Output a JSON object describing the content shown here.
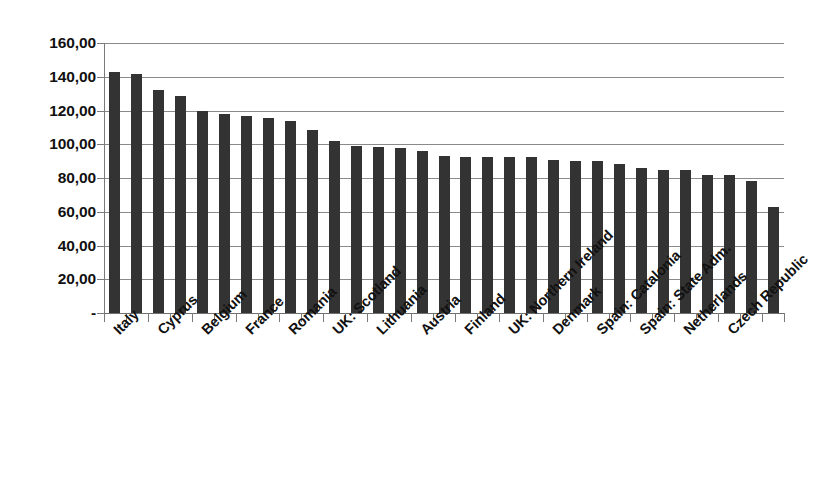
{
  "chart_data": {
    "type": "bar",
    "title": "",
    "subtitle": "",
    "xlabel": "",
    "ylabel": "",
    "ylim": [
      0,
      160
    ],
    "ytick_step": 20,
    "grid": true,
    "legend": false,
    "legend_position": "none",
    "bar_color": "#333333",
    "gridline_color": "#8a8a8a",
    "axis_color": "#7a7a7a",
    "label_rotation_degrees": -45,
    "decimal_separator": ",",
    "zero_tick_label": "-",
    "ytick_labels": [
      "160,00",
      "140,00",
      "120,00",
      "100,00",
      "80,00",
      "60,00",
      "40,00",
      "20,00",
      "-"
    ],
    "ytick_values": [
      160,
      140,
      120,
      100,
      80,
      60,
      40,
      20,
      0
    ],
    "categories": [
      "Italy",
      "",
      "Cyprus",
      "",
      "Belgium",
      "",
      "France",
      "",
      "Romania",
      "",
      "UK: Scotland",
      "",
      "Lithuania",
      "",
      "Austria",
      "",
      "Finland",
      "",
      "UK: Northern Ireland",
      "",
      "Denmark",
      "",
      "Spain: Catalonia",
      "",
      "Spain: State Adm.",
      "",
      "Netherlands",
      "",
      "Czech Republic",
      "",
      ""
    ],
    "visible_tick_labels": [
      "Italy",
      "Cyprus",
      "Belgium",
      "France",
      "Romania",
      "UK: Scotland",
      "Lithuania",
      "Austria",
      "Finland",
      "UK: Northern Ireland",
      "Denmark",
      "Spain: Catalonia",
      "Spain: State Adm.",
      "Netherlands",
      "Czech Republic"
    ],
    "values": [
      143.0,
      141.5,
      132.0,
      128.5,
      119.5,
      118.0,
      116.5,
      115.5,
      113.5,
      108.5,
      102.0,
      99.0,
      98.5,
      97.5,
      96.0,
      93.0,
      92.5,
      92.5,
      92.5,
      92.5,
      90.5,
      90.0,
      90.0,
      88.5,
      86.0,
      85.0,
      84.5,
      82.0,
      81.5,
      78.5,
      63.0
    ],
    "bar_count": 31,
    "values_label_pairs": [
      {
        "category": "Italy",
        "value": 143.0
      },
      {
        "category": "Cyprus",
        "value": 132.0
      },
      {
        "category": "Belgium",
        "value": 119.5
      },
      {
        "category": "France",
        "value": 116.5
      },
      {
        "category": "Romania",
        "value": 113.5
      },
      {
        "category": "UK: Scotland",
        "value": 102.0
      },
      {
        "category": "Lithuania",
        "value": 98.5
      },
      {
        "category": "Austria",
        "value": 96.0
      },
      {
        "category": "Finland",
        "value": 92.5
      },
      {
        "category": "UK: Northern Ireland",
        "value": 92.5
      },
      {
        "category": "Denmark",
        "value": 90.5
      },
      {
        "category": "Spain: Catalonia",
        "value": 90.0
      },
      {
        "category": "Spain: State Adm.",
        "value": 86.0
      },
      {
        "category": "Netherlands",
        "value": 84.5
      },
      {
        "category": "Czech Republic",
        "value": 81.5
      }
    ]
  }
}
